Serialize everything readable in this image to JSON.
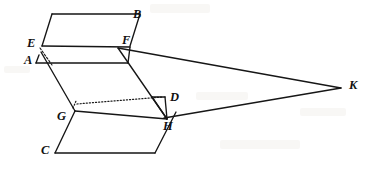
{
  "figure": {
    "kind": "geometry-diagram",
    "caption": "Two parallelogram slabs joined by segments, with rays converging at point K",
    "width": 378,
    "height": 170,
    "background_color": "#ffffff",
    "stroke_color": "#161616"
  },
  "labels": [
    {
      "id": "B",
      "text": "B",
      "x": 133,
      "y": 8,
      "name": "vertex-label-b"
    },
    {
      "id": "F",
      "text": "F",
      "x": 122,
      "y": 34,
      "name": "vertex-label-f"
    },
    {
      "id": "E",
      "text": "E",
      "x": 27,
      "y": 37,
      "name": "vertex-label-e"
    },
    {
      "id": "A",
      "text": "A",
      "x": 24,
      "y": 54,
      "name": "vertex-label-a"
    },
    {
      "id": "D",
      "text": "D",
      "x": 170,
      "y": 91,
      "name": "vertex-label-d"
    },
    {
      "id": "G",
      "text": "G",
      "x": 57,
      "y": 110,
      "name": "vertex-label-g"
    },
    {
      "id": "H",
      "text": "H",
      "x": 163,
      "y": 120,
      "name": "vertex-label-h"
    },
    {
      "id": "C",
      "text": "C",
      "x": 41,
      "y": 144,
      "name": "vertex-label-c"
    },
    {
      "id": "K",
      "text": "K",
      "x": 349,
      "y": 79,
      "name": "vertex-label-k"
    }
  ],
  "points": {
    "B": {
      "x": 131,
      "y": 14
    },
    "Btl": {
      "x": 52,
      "y": 14
    },
    "E": {
      "x": 42,
      "y": 46
    },
    "F": {
      "x": 118,
      "y": 47
    },
    "A": {
      "x": 39,
      "y": 55
    },
    "Ar": {
      "x": 128,
      "y": 63
    },
    "Al": {
      "x": 36,
      "y": 63
    },
    "G": {
      "x": 75,
      "y": 111
    },
    "D": {
      "x": 165,
      "y": 97
    },
    "Dl": {
      "x": 73,
      "y": 100
    },
    "H": {
      "x": 167,
      "y": 119
    },
    "C": {
      "x": 55,
      "y": 153
    },
    "Cr": {
      "x": 155,
      "y": 153
    },
    "K": {
      "x": 341,
      "y": 88
    }
  },
  "edges": [
    {
      "name": "edge-top-face-upper",
      "style": "solid",
      "path": "M 52 14 L 140 14 L 131 14"
    },
    {
      "name": "edge-b-to-f",
      "style": "solid",
      "path": "M 140 14 L 130 46"
    },
    {
      "name": "edge-top-left-slant",
      "style": "solid",
      "path": "M 52 14 L 42 46"
    },
    {
      "name": "edge-e-to-f",
      "style": "solid",
      "path": "M 42 46 L 130 47"
    },
    {
      "name": "edge-a-dashed-hidden",
      "style": "dashed",
      "path": "M 40 48 L 52 65"
    },
    {
      "name": "edge-front-left",
      "style": "solid",
      "path": "M 39 55 L 36 63"
    },
    {
      "name": "edge-front-bottom",
      "style": "solid",
      "path": "M 36 63 L 128 63"
    },
    {
      "name": "edge-front-right",
      "style": "solid",
      "path": "M 128 63 L 130 47"
    },
    {
      "name": "edge-a-to-g",
      "style": "solid",
      "path": "M 41 52 L 75 111"
    },
    {
      "name": "edge-f-to-h",
      "style": "solid",
      "path": "M 118 48 L 167 119"
    },
    {
      "name": "edge-g-to-d-dotted",
      "style": "dotted",
      "path": "M 77 104 L 163 97"
    },
    {
      "name": "edge-g-up-dotted",
      "style": "dotted",
      "path": "M 73 108 L 76 101"
    },
    {
      "name": "edge-d-down",
      "style": "solid",
      "path": "M 165 97 L 167 119"
    },
    {
      "name": "edge-d-left",
      "style": "solid",
      "path": "M 152 97 L 165 97"
    },
    {
      "name": "edge-d-inner-slant",
      "style": "solid",
      "path": "M 152 97 L 167 119"
    },
    {
      "name": "edge-g-to-h",
      "style": "solid",
      "path": "M 75 111 L 167 119"
    },
    {
      "name": "edge-g-to-c",
      "style": "solid",
      "path": "M 75 111 L 55 153"
    },
    {
      "name": "edge-c-to-cr",
      "style": "solid",
      "path": "M 55 153 L 155 153"
    },
    {
      "name": "edge-cr-to-h",
      "style": "solid",
      "path": "M 155 153 L 176 112"
    },
    {
      "name": "ray-f-to-k",
      "style": "ray",
      "path": "M 118 48 L 341 88"
    },
    {
      "name": "ray-h-to-k",
      "style": "ray",
      "path": "M 164 118 L 341 88"
    }
  ],
  "artifacts": [
    {
      "name": "scan-smudge-top",
      "x": 150,
      "y": 4,
      "w": 60,
      "h": 9
    },
    {
      "name": "scan-smudge-left",
      "x": 4,
      "y": 66,
      "w": 26,
      "h": 7
    },
    {
      "name": "scan-smudge-mid",
      "x": 196,
      "y": 92,
      "w": 52,
      "h": 8
    },
    {
      "name": "scan-smudge-bottom",
      "x": 220,
      "y": 140,
      "w": 80,
      "h": 9
    },
    {
      "name": "scan-smudge-right",
      "x": 300,
      "y": 108,
      "w": 46,
      "h": 8
    }
  ]
}
